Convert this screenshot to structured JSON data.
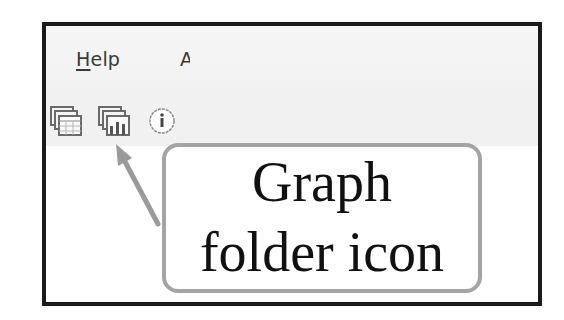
{
  "menubar": {
    "items": [
      {
        "label_accel": "H",
        "label_rest": "elp"
      },
      {
        "label": "A"
      }
    ]
  },
  "toolbar": {
    "icons": [
      {
        "name": "sheet-folder-icon"
      },
      {
        "name": "graph-folder-icon"
      },
      {
        "name": "info-icon"
      }
    ]
  },
  "callout": {
    "line1": "Graph",
    "line2": "folder icon",
    "border_color": "#a4a4a4",
    "arrow_color": "#9a9a9a"
  }
}
